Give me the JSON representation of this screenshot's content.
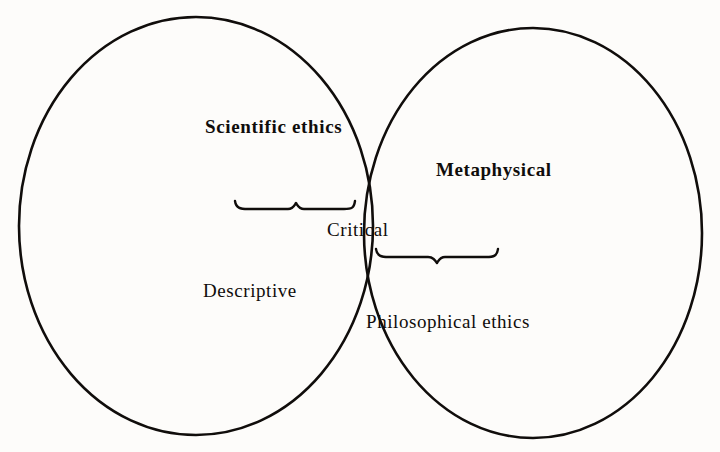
{
  "figure": {
    "type": "venn-diagram",
    "set_count": 2,
    "background_color": "#fdfcfa",
    "stroke_color": "#100d0b"
  },
  "labels": {
    "scientific_ethics": "Scientific ethics",
    "metaphysical": "Metaphysical",
    "critical": "Critical",
    "descriptive": "Descriptive",
    "philosophical_ethics": "Philosophical ethics"
  },
  "regions": {
    "left_only": [
      "Scientific ethics",
      "Descriptive"
    ],
    "right_only": [
      "Metaphysical",
      "Philosophical ethics"
    ],
    "intersection": [
      "Critical"
    ]
  },
  "annotations": {
    "upper_brace": "brace-pointing-to-critical-from-left",
    "lower_brace": "brace-pointing-to-critical-from-right"
  }
}
